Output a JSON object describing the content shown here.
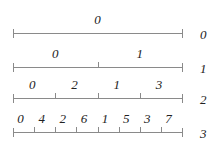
{
  "diagram": {
    "rows": [
      {
        "level": "0",
        "labels": [
          "0"
        ]
      },
      {
        "level": "1",
        "labels": [
          "0",
          "1"
        ]
      },
      {
        "level": "2",
        "labels": [
          "0",
          "2",
          "1",
          "3"
        ]
      },
      {
        "level": "3",
        "labels": [
          "0",
          "4",
          "2",
          "6",
          "1",
          "5",
          "3",
          "7"
        ]
      }
    ],
    "colors": {
      "line": "#8a8a8a",
      "text": "#222222"
    }
  }
}
